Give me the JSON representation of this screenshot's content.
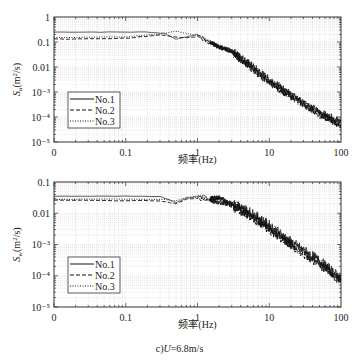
{
  "chart_data": [
    {
      "type": "line",
      "panel": "top",
      "xscale": "log",
      "yscale": "log",
      "xlabel": "频率(Hz)",
      "ylabel": "S_u(m²/s)",
      "xlim": [
        0.01,
        100
      ],
      "ylim": [
        1e-05,
        1
      ],
      "x_tick_labels": [
        "0",
        "0.1",
        "1",
        "10",
        "100"
      ],
      "y_tick_labels": [
        "10⁻⁵",
        "10⁻⁴",
        "10⁻³",
        "0.01",
        "0.1",
        "1"
      ],
      "grid": true,
      "legend": {
        "position": "lower-left",
        "entries": [
          "No.1",
          "No.2",
          "No.3"
        ]
      },
      "series": [
        {
          "name": "No.1",
          "style": "solid",
          "x": [
            0.01,
            0.2,
            0.35,
            0.5,
            0.7,
            1.0,
            1.5,
            2,
            3,
            5,
            10,
            20,
            50,
            100
          ],
          "y": [
            0.25,
            0.25,
            0.22,
            0.13,
            0.16,
            0.2,
            0.1,
            0.07,
            0.045,
            0.015,
            0.003,
            0.0008,
            0.00015,
            6e-05
          ]
        },
        {
          "name": "No.2",
          "style": "dashed",
          "x": [
            0.01,
            0.1,
            0.3,
            0.5,
            0.7,
            1.0,
            1.5,
            2,
            3,
            5,
            10,
            20,
            50,
            100
          ],
          "y": [
            0.13,
            0.14,
            0.19,
            0.16,
            0.15,
            0.16,
            0.09,
            0.06,
            0.04,
            0.012,
            0.0025,
            0.0007,
            0.00013,
            5e-05
          ]
        },
        {
          "name": "No.3",
          "style": "dotted",
          "x": [
            0.01,
            0.1,
            0.3,
            0.5,
            0.7,
            1.0,
            1.5,
            2,
            3,
            5,
            10,
            20,
            50,
            100
          ],
          "y": [
            0.15,
            0.16,
            0.21,
            0.27,
            0.22,
            0.18,
            0.1,
            0.065,
            0.04,
            0.013,
            0.0028,
            0.0007,
            0.00014,
            5e-05
          ]
        }
      ]
    },
    {
      "type": "line",
      "panel": "bottom",
      "xscale": "log",
      "yscale": "log",
      "xlabel": "频率(Hz)",
      "ylabel": "S_w(m²/s)",
      "xlim": [
        0.01,
        100
      ],
      "ylim": [
        1e-05,
        0.1
      ],
      "x_tick_labels": [
        "0",
        "0.1",
        "1",
        "10",
        "100"
      ],
      "y_tick_labels": [
        "10⁻⁵",
        "10⁻⁴",
        "10⁻³",
        "0.01",
        "0.1"
      ],
      "grid": true,
      "legend": {
        "position": "lower-left",
        "entries": [
          "No.1",
          "No.2",
          "No.3"
        ]
      },
      "series": [
        {
          "name": "No.1",
          "style": "solid",
          "x": [
            0.01,
            0.3,
            0.5,
            0.7,
            1.0,
            1.5,
            2,
            3,
            5,
            10,
            20,
            50,
            100
          ],
          "y": [
            0.035,
            0.035,
            0.022,
            0.03,
            0.035,
            0.03,
            0.032,
            0.02,
            0.012,
            0.004,
            0.0012,
            0.0003,
            8e-05
          ]
        },
        {
          "name": "No.2",
          "style": "dashed",
          "x": [
            0.01,
            0.3,
            0.5,
            0.7,
            1.0,
            1.5,
            2,
            3,
            5,
            10,
            20,
            50,
            100
          ],
          "y": [
            0.026,
            0.025,
            0.02,
            0.028,
            0.03,
            0.025,
            0.022,
            0.018,
            0.009,
            0.003,
            0.001,
            0.00025,
            7e-05
          ]
        },
        {
          "name": "No.3",
          "style": "dotted",
          "x": [
            0.01,
            0.3,
            0.5,
            0.7,
            1.0,
            1.5,
            2,
            3,
            5,
            10,
            20,
            50,
            100
          ],
          "y": [
            0.028,
            0.028,
            0.025,
            0.032,
            0.033,
            0.028,
            0.03,
            0.02,
            0.01,
            0.0035,
            0.001,
            0.00026,
            7e-05
          ]
        }
      ]
    }
  ],
  "caption": {
    "prefix": "c)",
    "var": "U",
    "rest": "=6.8m/s"
  }
}
